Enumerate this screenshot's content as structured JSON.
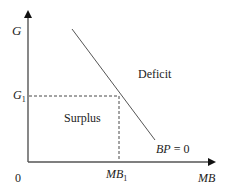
{
  "diagram": {
    "type": "economics-line-diagram",
    "axes": {
      "y_label": "G",
      "x_label": "MB",
      "origin_label": "0"
    },
    "curve": {
      "label": "BP = 0",
      "label_parts": {
        "left": "BP",
        "op": " = ",
        "right": "0"
      }
    },
    "reference_point": {
      "y_label": "G",
      "y_sub": "1",
      "x_label": "MB",
      "x_sub": "1"
    },
    "regions": {
      "above": "Deficit",
      "below": "Surplus"
    },
    "colors": {
      "axis": "#222222",
      "curve": "#444444",
      "dashed": "#333333",
      "text": "#222222"
    }
  }
}
